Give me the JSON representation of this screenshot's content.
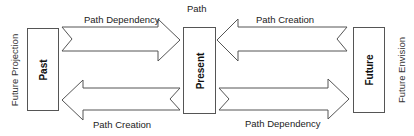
{
  "diagram": {
    "top_label": "Path",
    "boxes": {
      "past": "Past",
      "present": "Present",
      "future": "Future"
    },
    "side_labels": {
      "left": "Future Projection",
      "right": "Future Envision"
    },
    "arrows": [
      {
        "label": "Path Dependency",
        "from": "Past",
        "to": "Present",
        "position": "top-left"
      },
      {
        "label": "Path Creation",
        "from": "Future",
        "to": "Present",
        "position": "top-right"
      },
      {
        "label": "Path Creation",
        "from": "Present",
        "to": "Past",
        "position": "bottom-left"
      },
      {
        "label": "Path Dependency",
        "from": "Present",
        "to": "Future",
        "position": "bottom-right"
      }
    ],
    "colors": {
      "stroke": "#555555",
      "fill": "#ffffff",
      "text": "#222222"
    }
  }
}
